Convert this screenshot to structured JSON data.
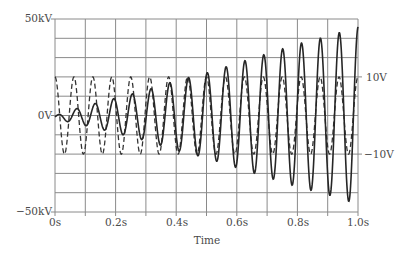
{
  "chart_data": {
    "type": "line",
    "title": "",
    "xlabel": "Time",
    "ylabel_left": "",
    "ylabel_right": "",
    "xlim": [
      0,
      1.0
    ],
    "ylim_left": [
      -50000,
      50000
    ],
    "ylim_right": [
      -25,
      25
    ],
    "grid": true,
    "grid_divisions": {
      "x": 10,
      "y": 10
    },
    "x_ticks": [
      "0s",
      "0.2s",
      "0.4s",
      "0.6s",
      "0.8s",
      "1.0s"
    ],
    "y_ticks_left": [
      "50kV",
      "0V",
      "-50kV"
    ],
    "y_ticks_right": [
      "10V",
      "-10V"
    ],
    "series": [
      {
        "name": "output-voltage",
        "axis": "left",
        "style": "solid",
        "unit": "V",
        "frequency_hz": 16,
        "description": "Sinusoid whose amplitude grows from ~0 to ~46kV over 1s",
        "peak_envelope": [
          {
            "t": 0.0,
            "amp": 1000
          },
          {
            "t": 0.1,
            "amp": 5000
          },
          {
            "t": 0.2,
            "amp": 9000
          },
          {
            "t": 0.3,
            "amp": 13000
          },
          {
            "t": 0.4,
            "amp": 18000
          },
          {
            "t": 0.5,
            "amp": 22000
          },
          {
            "t": 0.6,
            "amp": 27000
          },
          {
            "t": 0.7,
            "amp": 32000
          },
          {
            "t": 0.8,
            "amp": 37000
          },
          {
            "t": 0.9,
            "amp": 41000
          },
          {
            "t": 1.0,
            "amp": 46000
          }
        ]
      },
      {
        "name": "input-voltage",
        "axis": "right",
        "style": "dashed",
        "unit": "V",
        "frequency_hz": 16,
        "amplitude": 10,
        "description": "Constant-amplitude sinusoid, ±10V"
      }
    ]
  },
  "labels": {
    "y_left_top": "50kV",
    "y_left_mid": "0V",
    "y_left_bottom": "−50kV",
    "y_right_top": "10V",
    "y_right_bottom": "−10V",
    "x0": "0s",
    "x1": "0.2s",
    "x2": "0.4s",
    "x3": "0.6s",
    "x4": "0.8s",
    "x5": "1.0s",
    "xlabel": "Time"
  },
  "colors": {
    "grid": "#8a8a8a",
    "frame": "#8a8a8a",
    "solid_trace": "#2a2a2a",
    "dashed_trace": "#3a3a3a"
  }
}
